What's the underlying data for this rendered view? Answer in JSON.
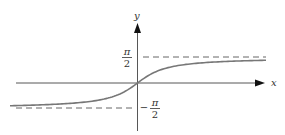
{
  "diagram": {
    "function": "y = arctan(x)",
    "axes": {
      "x_label": "x",
      "y_label": "y"
    },
    "asymptotes": [
      {
        "name": "upper",
        "numerator": "π",
        "denominator": "2",
        "sign": ""
      },
      {
        "name": "lower",
        "numerator": "π",
        "denominator": "2",
        "sign": "−"
      }
    ],
    "colors": {
      "curve": "#777777",
      "axis": "#444444",
      "dash": "#555555",
      "text": "#333333"
    }
  },
  "chart_data": {
    "type": "line",
    "title": "",
    "xlabel": "x",
    "ylabel": "y",
    "series": [
      {
        "name": "arctan(x)",
        "function": "arctan(x)"
      }
    ],
    "annotations": [
      {
        "text": "π/2",
        "kind": "horizontal-asymptote",
        "y": 1.5708
      },
      {
        "text": "−π/2",
        "kind": "horizontal-asymptote",
        "y": -1.5708
      }
    ],
    "grid": false,
    "legend": "none"
  }
}
